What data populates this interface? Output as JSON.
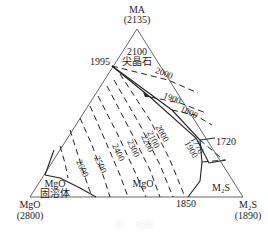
{
  "diagram": {
    "type": "ternary-phase-diagram",
    "vertices": {
      "top": {
        "label": "MA",
        "temp": "(2135)"
      },
      "bottom_left": {
        "label": "MgO",
        "temp": "(2800)"
      },
      "bottom_right": {
        "label": "M₂S",
        "temp": "(1890)"
      }
    },
    "points": {
      "p1995": "1995",
      "p1720": "1720",
      "p1850": "1850"
    },
    "regions": {
      "spinel_temp": "2100",
      "spinel": "尖晶石",
      "mgo_ss_1": "MgO",
      "mgo_ss_2": "固溶体",
      "mgo": "MgO",
      "m2s": "M₂S"
    },
    "isotherms": [
      "2000",
      "1900",
      "1800",
      "1770",
      "1900",
      "2000",
      "2100",
      "2200",
      "2300",
      "2400",
      "2500",
      "2600"
    ],
    "caption": "图 ... 相图"
  }
}
